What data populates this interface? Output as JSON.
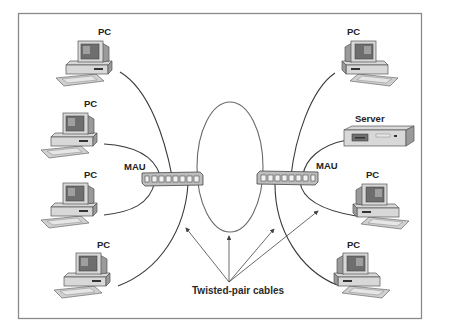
{
  "diagram": {
    "type": "token-ring-network",
    "caption": "Twisted-pair cables",
    "hubs": [
      {
        "id": "mau-left",
        "label": "MAU"
      },
      {
        "id": "mau-right",
        "label": "MAU"
      }
    ],
    "left_nodes": [
      {
        "id": "pc-left-1",
        "label": "PC"
      },
      {
        "id": "pc-left-2",
        "label": "PC"
      },
      {
        "id": "pc-left-3",
        "label": "PC"
      },
      {
        "id": "pc-left-4",
        "label": "PC"
      }
    ],
    "right_nodes": [
      {
        "id": "pc-right-1",
        "label": "PC"
      },
      {
        "id": "server",
        "label": "Server"
      },
      {
        "id": "pc-right-2",
        "label": "PC"
      },
      {
        "id": "pc-right-3",
        "label": "PC"
      }
    ],
    "colors": {
      "frame": "#8a8a8a",
      "cable": "#3a3a3a",
      "device_fill": "#d8d8d8",
      "device_shadow": "#9a9a9a",
      "background": "#ffffff"
    }
  }
}
